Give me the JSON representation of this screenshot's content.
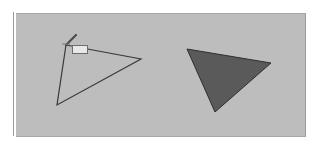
{
  "canvas": {
    "background_color": "#bdbdbd",
    "border_color": "#a8a8a8"
  },
  "shapes": [
    {
      "type": "triangle",
      "style": "outline",
      "stroke_color": "#3a3a3a",
      "fill_color": "none",
      "points": [
        [
          66,
          45
        ],
        [
          141,
          59
        ],
        [
          57,
          105
        ]
      ]
    },
    {
      "type": "triangle",
      "style": "filled",
      "stroke_color": "#2e2e2e",
      "fill_color": "#5a5a5a",
      "points": [
        [
          187,
          49
        ],
        [
          271,
          63
        ],
        [
          215,
          112
        ]
      ]
    }
  ],
  "cursor": {
    "icon": "pen-icon",
    "position": [
      66,
      45
    ],
    "tooltip_text": ""
  }
}
